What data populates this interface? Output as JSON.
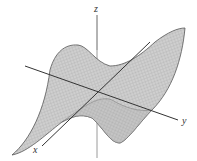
{
  "figure": {
    "type": "3d-surface-plot",
    "axes": {
      "x": {
        "label": "x"
      },
      "y": {
        "label": "y"
      },
      "z": {
        "label": "z"
      }
    },
    "colors": {
      "surface_fill": "#c8c8c8",
      "mesh_lines": "#9a9a9a",
      "surface_edge": "#555555",
      "axis_dark": "#333333",
      "axis_light": "#9a9a9a",
      "background": "#ffffff"
    }
  }
}
